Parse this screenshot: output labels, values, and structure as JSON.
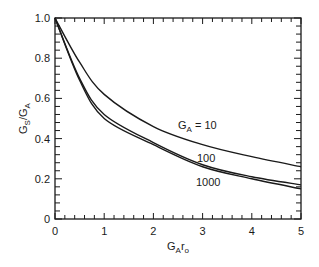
{
  "chart_data": {
    "type": "line",
    "title": "",
    "xlabel": "G_A r_0",
    "xlabel_parts": {
      "main": "G",
      "sub": "A",
      "main2": "r",
      "sub2": "o"
    },
    "ylabel": "G_S / G_A",
    "ylabel_parts": {
      "main": "G",
      "sub": "S",
      "sep": "/",
      "main2": "G",
      "sub2": "A"
    },
    "xlim": [
      0,
      5
    ],
    "ylim": [
      0,
      1.0
    ],
    "x_ticks": [
      "0",
      "1",
      "2",
      "3",
      "4",
      "5"
    ],
    "y_ticks": [
      "0",
      "0.2",
      "0.4",
      "0.6",
      "0.8",
      "1.0"
    ],
    "grid": false,
    "legend": "inline curve labels",
    "x": [
      0,
      0.5,
      1,
      2,
      3,
      4,
      5
    ],
    "series": [
      {
        "name": "G_A = 10",
        "label": "G",
        "label_sub": "A",
        "label_rest": " = 10",
        "values": [
          1.0,
          0.78,
          0.62,
          0.46,
          0.37,
          0.31,
          0.26
        ]
      },
      {
        "name": "100",
        "label": "100",
        "values": [
          1.0,
          0.7,
          0.52,
          0.38,
          0.27,
          0.21,
          0.17
        ]
      },
      {
        "name": "1000",
        "label": "1000",
        "values": [
          1.0,
          0.69,
          0.5,
          0.37,
          0.26,
          0.2,
          0.15
        ]
      }
    ],
    "colors": {
      "line": "#1a1a1a",
      "axis": "#1a1a1a",
      "background": "#ffffff"
    }
  }
}
